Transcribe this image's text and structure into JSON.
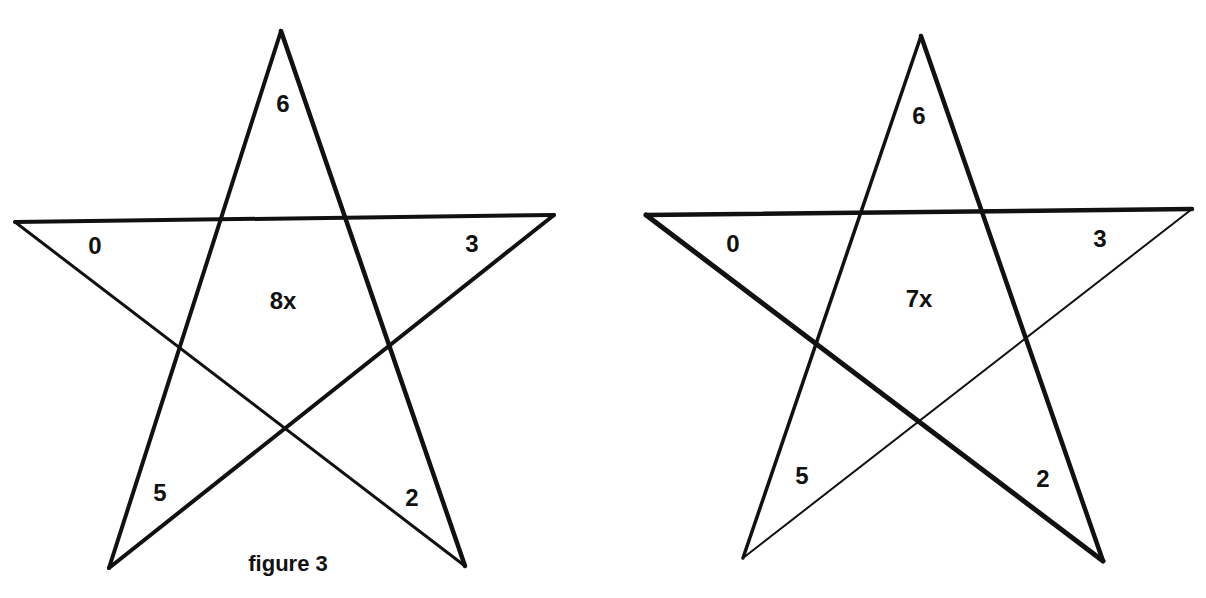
{
  "figure": {
    "caption": "figure 3",
    "ink_color": "#111111",
    "background_color": "#ffffff"
  },
  "stars": [
    {
      "id": "left-star",
      "points": {
        "top": [
          281,
          31
        ],
        "left": [
          15,
          222
        ],
        "right": [
          554,
          215
        ],
        "bottom_left": [
          109,
          568
        ],
        "bottom_right": [
          465,
          566
        ]
      },
      "stroke_widths": {
        "top_to_bottom_left": 4,
        "top_to_bottom_right": 4.5,
        "left_to_right": 4,
        "left_to_bottom_right": 3,
        "bottom_left_to_right": 4
      },
      "labels": {
        "top": "6",
        "left": "0",
        "right": "3",
        "bottom_left": "5",
        "bottom_right": "2",
        "center": "8x"
      },
      "label_positions": {
        "top": [
          283,
          112
        ],
        "left": [
          95,
          254
        ],
        "right": [
          472,
          252
        ],
        "bottom_left": [
          160,
          501
        ],
        "bottom_right": [
          412,
          506
        ],
        "center": [
          283,
          309
        ]
      }
    },
    {
      "id": "right-star",
      "points": {
        "top": [
          921,
          36
        ],
        "left": [
          646,
          215
        ],
        "right": [
          1192,
          209
        ],
        "bottom_left": [
          743,
          558
        ],
        "bottom_right": [
          1103,
          561
        ]
      },
      "stroke_widths": {
        "top_to_bottom_left": 3.5,
        "top_to_bottom_right": 4.5,
        "left_to_right": 4.5,
        "left_to_bottom_right": 5,
        "bottom_left_to_right": 2
      },
      "labels": {
        "top": "6",
        "left": "0",
        "right": "3",
        "bottom_left": "5",
        "bottom_right": "2",
        "center": "7x"
      },
      "label_positions": {
        "top": [
          919,
          124
        ],
        "left": [
          733,
          252
        ],
        "right": [
          1100,
          247
        ],
        "bottom_left": [
          802,
          484
        ],
        "bottom_right": [
          1043,
          487
        ],
        "center": [
          919,
          307
        ]
      }
    }
  ],
  "caption_position": [
    288,
    571
  ]
}
